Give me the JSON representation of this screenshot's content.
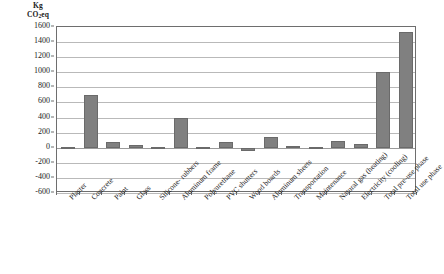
{
  "chart_data": {
    "type": "bar",
    "title": "",
    "xlabel": "",
    "ylabel": "Kg CO2eq",
    "ylabel_main": "Kg",
    "ylabel_sub_pre": "CO",
    "ylabel_sub_num": "2",
    "ylabel_sub_post": "eq",
    "ylim": [
      -600,
      1600
    ],
    "ytick_step": 200,
    "yticks": [
      1600,
      1400,
      1200,
      1000,
      800,
      600,
      400,
      200,
      0,
      -200,
      -400,
      -600
    ],
    "ytick_labels": [
      "1600",
      "1400",
      "1200",
      "1000",
      "800",
      "600",
      "400",
      "200",
      "0",
      "-200",
      "-400",
      "-600"
    ],
    "grid": true,
    "legend": "none",
    "bar_color": "#808080",
    "bar_edge_color": "#6a6a6a",
    "grid_color": "#b9b9b9",
    "axis_color": "#6e6e6e",
    "categories": [
      "Plaster",
      "Concrete",
      "Paint",
      "Glass",
      "Silicone- rubbers",
      "Aluminum frame",
      "Polyurethane",
      "PVC shutters",
      "Wood boards",
      "Aluminum sheets",
      "Transportation",
      "Maintenance",
      "Natural gas (heating)",
      "Electricity (cooling)",
      "Total pre-use phase",
      "Total use phase"
    ],
    "values": [
      10,
      700,
      70,
      35,
      8,
      390,
      12,
      75,
      -40,
      140,
      18,
      12,
      90,
      55,
      1000,
      1540
    ],
    "last_value": 1050,
    "series": [
      {
        "name": "Kg CO2eq",
        "values": [
          10,
          700,
          70,
          35,
          8,
          390,
          12,
          75,
          -40,
          140,
          18,
          12,
          90,
          55,
          1000,
          1540
        ]
      }
    ]
  }
}
